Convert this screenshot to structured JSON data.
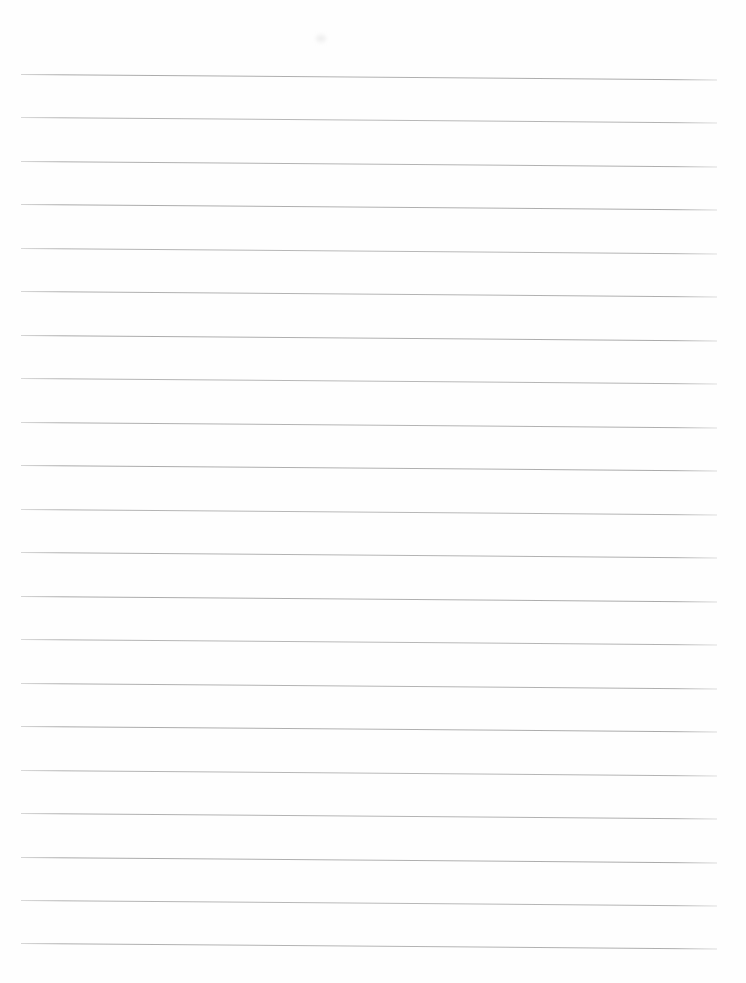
{
  "page": {
    "type": "blank-lined-paper",
    "background_color": "#fefefe",
    "line_color": "#989898",
    "line_count": 21,
    "line_left_x": 21,
    "line_length": 696,
    "line_thickness_px": 1,
    "line_slope_deg": 0.45,
    "line_y_positions": [
      74,
      117,
      161,
      204,
      248,
      291,
      335,
      378,
      422,
      465,
      509,
      552,
      596,
      639,
      683,
      726,
      770,
      813,
      857,
      900,
      943
    ],
    "artifact": {
      "x": 316,
      "y": 35,
      "width": 10,
      "height": 7,
      "color": "rgba(205,205,205,0.35)",
      "note": "faint smudge near top center"
    }
  }
}
